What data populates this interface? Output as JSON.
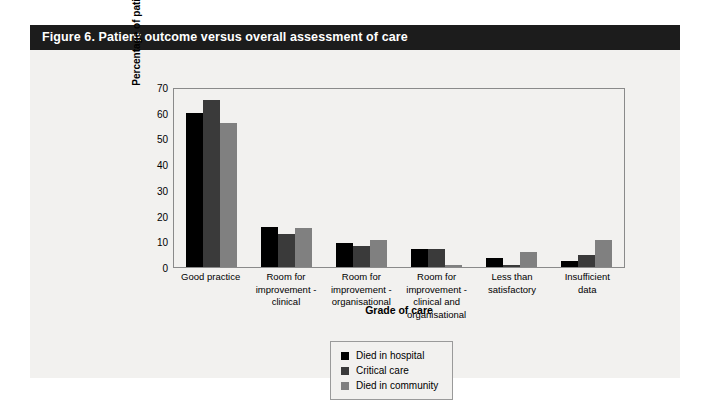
{
  "figure": {
    "caption": "Figure 6. Patient outcome versus overall assessment of care",
    "header_bg": "#1c1c1c",
    "card_bg": "#f2f1ef"
  },
  "chart_data": {
    "type": "bar",
    "title": "Figure 6. Patient outcome versus overall assessment of care",
    "xlabel": "Grade of care",
    "ylabel": "Percentage of patients",
    "ylim": [
      0,
      70
    ],
    "yticks": [
      0,
      10,
      20,
      30,
      40,
      50,
      60,
      70
    ],
    "grid": false,
    "legend_position": "bottom-center",
    "categories": [
      "Good practice",
      "Room for improvement - clinical",
      "Room for improvement - organisational",
      "Room for improvement - clinical and organisational",
      "Less than satisfactory",
      "Insufficient data"
    ],
    "category_lines": [
      [
        "Good practice"
      ],
      [
        "Room for",
        "improvement -",
        "clinical"
      ],
      [
        "Room for",
        "improvement -",
        "organisational"
      ],
      [
        "Room for",
        "improvement -",
        "clinical and",
        "organisational"
      ],
      [
        "Less than",
        "satisfactory"
      ],
      [
        "Insufficient",
        "data"
      ]
    ],
    "series": [
      {
        "name": "Died in hospital",
        "color": "#000000",
        "values": [
          60,
          15.5,
          9.5,
          7,
          3.5,
          2.5
        ]
      },
      {
        "name": "Critical care",
        "color": "#3a3a3a",
        "values": [
          65,
          13,
          8,
          7,
          0.5,
          4.5
        ]
      },
      {
        "name": "Died in community",
        "color": "#808080",
        "values": [
          56,
          15,
          10.5,
          0.3,
          6,
          10.5
        ]
      }
    ]
  }
}
